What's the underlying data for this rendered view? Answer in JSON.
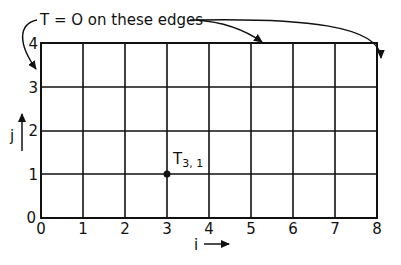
{
  "annotation": {
    "text": "T = O on these edges"
  },
  "grid": {
    "i_ticks": [
      "0",
      "1",
      "2",
      "3",
      "4",
      "5",
      "6",
      "7",
      "8"
    ],
    "j_ticks": [
      "0",
      "1",
      "2",
      "3",
      "4"
    ],
    "i_axis_label": "i",
    "j_axis_label": "j"
  },
  "point": {
    "label": "T3,1",
    "label_main": "T",
    "label_sub": "3, 1",
    "i": 3,
    "j": 1
  },
  "colors": {
    "ink": "#111111",
    "background": "#ffffff"
  }
}
